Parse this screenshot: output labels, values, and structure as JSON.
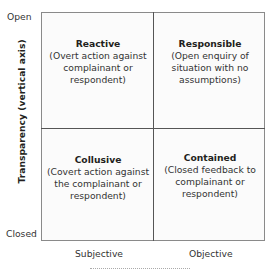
{
  "y_axis": {
    "title": "Transparency (vertical axis)",
    "top_label": "Open",
    "bottom_label": "Closed"
  },
  "x_axis": {
    "left_label": "Subjective",
    "right_label": "Objective"
  },
  "quadrants": {
    "top_left": {
      "title": "Reactive",
      "desc": "(Overt action against complainant or respondent)"
    },
    "top_right": {
      "title": "Responsible",
      "desc": "(Open enquiry of situation with no assumptions)"
    },
    "bottom_left": {
      "title": "Collusive",
      "desc": "(Covert action against the complainant or respondent)"
    },
    "bottom_right": {
      "title": "Contained",
      "desc": "(Closed feedback to complainant or respondent)"
    }
  }
}
